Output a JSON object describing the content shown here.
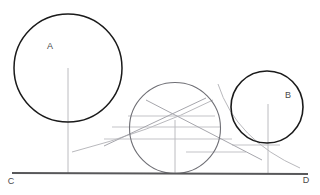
{
  "figure": {
    "background": "#ffffff",
    "width": 320,
    "height": 195,
    "colors": {
      "primary_stroke": "#1a1a1a",
      "baseline_stroke": "#58585a",
      "construction_stroke": "#b9b9bd",
      "construction_stroke_dark": "#9a9aa0",
      "label_fill": "#4a4a4a"
    },
    "labels": [
      {
        "name": "label-a",
        "text": "A",
        "x": 50,
        "y": 47
      },
      {
        "name": "label-b",
        "text": "B",
        "x": 288,
        "y": 96
      },
      {
        "name": "label-c",
        "text": "C",
        "x": 11,
        "y": 182
      },
      {
        "name": "label-d",
        "text": "D",
        "x": 306,
        "y": 181
      }
    ],
    "baseline": {
      "name": "baseline-cd",
      "x1": 12,
      "y1": 173,
      "x2": 308,
      "y2": 174,
      "width": 2.2
    },
    "circles": [
      {
        "name": "circle-a",
        "label": "A",
        "cx": 68,
        "cy": 68,
        "r": 54,
        "width": 1.5
      },
      {
        "name": "circle-middle",
        "cx": 175,
        "cy": 128,
        "r": 45.5,
        "width": 1.1
      },
      {
        "name": "circle-b",
        "label": "B",
        "cx": 267,
        "cy": 107,
        "r": 36,
        "width": 1.6
      }
    ],
    "radii_lines": [
      {
        "name": "radius-line-a",
        "x1": 68,
        "y1": 68,
        "x2": 68,
        "y2": 173
      },
      {
        "name": "radius-line-middle",
        "x1": 175,
        "y1": 120,
        "x2": 175,
        "y2": 173
      },
      {
        "name": "radius-line-b",
        "x1": 268,
        "y1": 104,
        "x2": 268,
        "y2": 173
      }
    ],
    "construction_horizontals": [
      {
        "name": "construction-horizontal-1",
        "x1": 128,
        "y1": 116,
        "x2": 215,
        "y2": 116
      },
      {
        "name": "construction-horizontal-2",
        "x1": 112,
        "y1": 127,
        "x2": 220,
        "y2": 127
      },
      {
        "name": "construction-horizontal-3",
        "x1": 104,
        "y1": 139,
        "x2": 232,
        "y2": 139
      },
      {
        "name": "construction-horizontal-4",
        "x1": 186,
        "y1": 152,
        "x2": 246,
        "y2": 152
      },
      {
        "name": "construction-horizontal-5",
        "x1": 232,
        "y1": 145,
        "x2": 280,
        "y2": 145
      }
    ],
    "construction_diagonals": [
      {
        "name": "construction-diagonal-down",
        "x1": 146,
        "y1": 100,
        "x2": 262,
        "y2": 160
      },
      {
        "name": "construction-diagonal-up",
        "x1": 206,
        "y1": 98,
        "x2": 104,
        "y2": 146
      }
    ],
    "construction_arcs": [
      {
        "name": "construction-arc-left",
        "d": "M 72,152 Q 150,132 213,100"
      },
      {
        "name": "construction-arc-right",
        "d": "M 218,84 Q 236,140 300,168"
      }
    ]
  }
}
